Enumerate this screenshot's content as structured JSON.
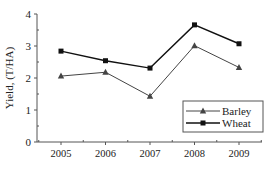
{
  "chart_data": {
    "type": "line",
    "title": "",
    "xlabel": "",
    "ylabel": "Yield, (T/HA)",
    "categories": [
      "2005",
      "2006",
      "2007",
      "2008",
      "2009"
    ],
    "ylim": [
      0,
      4
    ],
    "yticks": [
      0,
      1,
      2,
      3,
      4
    ],
    "grid": false,
    "legend_position": "lower right",
    "series": [
      {
        "name": "Barley",
        "marker": "triangle",
        "color": "#444444",
        "values": [
          2.06,
          2.18,
          1.43,
          3.01,
          2.33
        ]
      },
      {
        "name": "Wheat",
        "marker": "square",
        "color": "#111111",
        "values": [
          2.84,
          2.54,
          2.31,
          3.66,
          3.07
        ]
      }
    ]
  }
}
